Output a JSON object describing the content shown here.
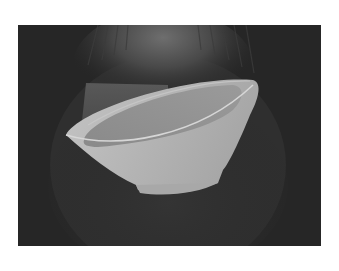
{
  "figure": {
    "colors": {
      "page_background": "#ffffff",
      "panel_background": "#262626",
      "scan_glow": "#6a6a6a",
      "bowl_outer": "#b4b4b4",
      "bowl_inner": "#8e8e8e",
      "bowl_rim": "#cfcfcf"
    }
  }
}
